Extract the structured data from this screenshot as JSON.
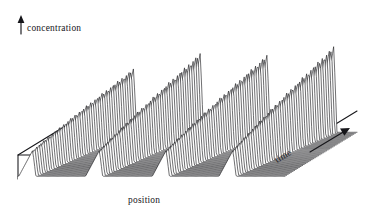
{
  "figure": {
    "kind": "waterfall-3d-surface",
    "background_color": "#ffffff",
    "line_color": "#16161a"
  },
  "labels": {
    "concentration": "concentration",
    "position": "position",
    "time": "time"
  },
  "icons": {
    "concentration_arrow": "up-arrow-icon",
    "time_arrow": "diagonal-arrow-icon"
  },
  "chart_data": {
    "type": "line",
    "title": "",
    "subtitle": "",
    "xlabel": "position",
    "ylabel": "concentration",
    "zlabel": "time",
    "grid": false,
    "legend": null,
    "legend_position": "none",
    "annotations": [
      {
        "text": "concentration",
        "role": "y-axis-label",
        "arrow": "up"
      },
      {
        "text": "position",
        "role": "x-axis-label",
        "arrow": "none"
      },
      {
        "text": "time",
        "role": "depth-axis-label",
        "arrow": "up-right"
      }
    ],
    "n_traces": 46,
    "n_points_per_trace": 241,
    "xlim": [
      0,
      1
    ],
    "ylim": [
      0,
      1
    ],
    "zlim": [
      0,
      1
    ],
    "x_tick_labels": [],
    "y_tick_labels": [],
    "z_tick_labels": [],
    "waves": {
      "count": 4,
      "peak_shape": "asymmetric-sawtooth",
      "rise_width": 0.052,
      "fall_width": 0.012,
      "baseline": 0.02,
      "amplitude": 1.0,
      "spacing": 0.25,
      "drift_per_trace": 0.00235,
      "envelope": [
        {
          "wave": 1,
          "start_height": 0.3,
          "end_height": 0.74
        },
        {
          "wave": 2,
          "start_height": 0.3,
          "end_height": 0.92
        },
        {
          "wave": 3,
          "start_height": 0.3,
          "end_height": 0.9
        },
        {
          "wave": 4,
          "start_height": 0.3,
          "end_height": 1.0
        }
      ],
      "peak_positions_first_trace": [
        0.055,
        0.305,
        0.555,
        0.805
      ],
      "peak_positions_last_trace": [
        0.163,
        0.413,
        0.663,
        0.913
      ]
    },
    "series": [
      {
        "name": "trace-01",
        "time_index": 0,
        "peak_heights": [
          0.3,
          0.3,
          0.3,
          0.3
        ]
      },
      {
        "name": "trace-06",
        "time_index": 5,
        "peak_heights": [
          0.35,
          0.37,
          0.36,
          0.38
        ]
      },
      {
        "name": "trace-12",
        "time_index": 11,
        "peak_heights": [
          0.42,
          0.47,
          0.46,
          0.5
        ]
      },
      {
        "name": "trace-18",
        "time_index": 17,
        "peak_heights": [
          0.5,
          0.57,
          0.56,
          0.62
        ]
      },
      {
        "name": "trace-24",
        "time_index": 23,
        "peak_heights": [
          0.57,
          0.66,
          0.65,
          0.73
        ]
      },
      {
        "name": "trace-30",
        "time_index": 29,
        "peak_heights": [
          0.64,
          0.76,
          0.74,
          0.83
        ]
      },
      {
        "name": "trace-36",
        "time_index": 35,
        "peak_heights": [
          0.69,
          0.84,
          0.82,
          0.92
        ]
      },
      {
        "name": "trace-46",
        "time_index": 45,
        "peak_heights": [
          0.74,
          0.92,
          0.9,
          1.0
        ]
      }
    ],
    "projection": {
      "origin_x": 18,
      "origin_y": 178,
      "x_axis_vector": [
        267,
        0
      ],
      "z_axis_vector": [
        72,
        -44
      ],
      "y_axis_scale": -108
    },
    "base_slab": {
      "front_left": [
        18,
        155
      ],
      "front_right": [
        285,
        155
      ],
      "bottom_left": [
        18,
        179
      ],
      "bottom_right": [
        285,
        179
      ],
      "back_left": [
        90,
        111
      ],
      "back_right": [
        357,
        111
      ]
    }
  }
}
